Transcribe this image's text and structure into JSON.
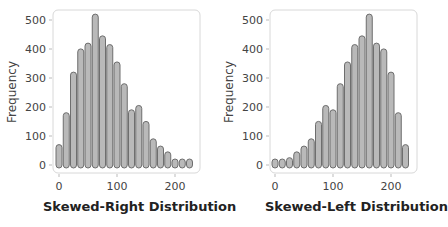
{
  "chart_data": [
    {
      "type": "bar",
      "title": "",
      "xlabel": "Skewed-Right Distribution",
      "ylabel": "Frequency",
      "x_ticks": [
        0,
        100,
        200
      ],
      "y_ticks": [
        0,
        100,
        200,
        300,
        400,
        500
      ],
      "ylim": [
        0,
        520
      ],
      "xlim": [
        -5,
        235
      ],
      "bin_width": 12.5,
      "categories": [
        0,
        12.5,
        25,
        37.5,
        50,
        62.5,
        75,
        87.5,
        100,
        112.5,
        125,
        137.5,
        150,
        162.5,
        175,
        187.5,
        200,
        212.5,
        225
      ],
      "values": [
        60,
        170,
        310,
        390,
        410,
        510,
        435,
        405,
        345,
        270,
        180,
        195,
        140,
        80,
        55,
        35,
        10,
        10,
        10
      ],
      "grid": false,
      "legend": null
    },
    {
      "type": "bar",
      "title": "",
      "xlabel": "Skewed-Left Distribution",
      "ylabel": "Frequency",
      "x_ticks": [
        0,
        100,
        200
      ],
      "y_ticks": [
        0,
        100,
        200,
        300,
        400,
        500
      ],
      "ylim": [
        0,
        520
      ],
      "xlim": [
        -5,
        235
      ],
      "bin_width": 12.5,
      "categories": [
        0,
        12.5,
        25,
        37.5,
        50,
        62.5,
        75,
        87.5,
        100,
        112.5,
        125,
        137.5,
        150,
        162.5,
        175,
        187.5,
        200,
        212.5,
        225
      ],
      "values": [
        10,
        10,
        15,
        35,
        55,
        80,
        140,
        195,
        180,
        270,
        345,
        405,
        435,
        510,
        410,
        390,
        310,
        170,
        60
      ],
      "grid": false,
      "legend": null
    }
  ],
  "colors": {
    "bar_fill": "#b9b9b9",
    "bar_stroke": "#6e6e6e",
    "frame": "#d8d8d8",
    "tick_text": "#444444",
    "label_text": "#222222"
  },
  "charts": [
    {
      "ylabel": "Frequency",
      "xlabel": "Skewed-Right Distribution",
      "ytick_labels": [
        "0",
        "100",
        "200",
        "300",
        "400",
        "500"
      ],
      "xtick_labels": [
        "0",
        "100",
        "200"
      ]
    },
    {
      "ylabel": "Frequency",
      "xlabel": "Skewed-Left Distribution",
      "ytick_labels": [
        "0",
        "100",
        "200",
        "300",
        "400",
        "500"
      ],
      "xtick_labels": [
        "0",
        "100",
        "200"
      ]
    }
  ]
}
